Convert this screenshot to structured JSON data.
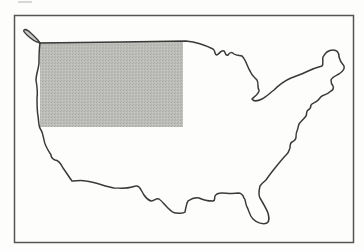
{
  "figure": {
    "type": "outline-map",
    "region": "Contiguous United States",
    "frame": {
      "x": 14,
      "y": 15,
      "width": 340,
      "height": 228,
      "stroke": "#555555"
    },
    "highlight": {
      "description": "Shaded rectangular region over the northwestern United States",
      "x": 40,
      "y": 42,
      "width": 143,
      "height": 85,
      "fill": "#b8b8b4"
    },
    "outline_stroke": "#3a3a3a",
    "background": "#fdfdfb"
  }
}
